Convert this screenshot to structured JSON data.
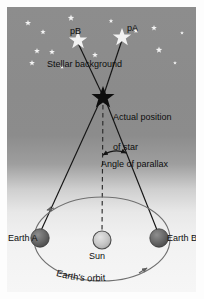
{
  "diagram": {
    "labels": {
      "star_pB": "pB",
      "star_pA": "pA",
      "stellar_background": "Stellar background",
      "actual_position_line1": "Actual position",
      "actual_position_line2": "of star",
      "angle_of_parallax": "Angle of parallax",
      "earth_a": "Earth A",
      "sun": "Sun",
      "earth_b": "Earth B",
      "earths_orbit": "Earth's orbit"
    },
    "colors": {
      "background_top": "#8d8d8d",
      "background_bottom": "#f6f6f6",
      "star_fill": "#f2f2f2",
      "actual_star_fill": "#0d0d0d",
      "line_stroke": "#141414",
      "orbit_stroke": "#6f6f6f",
      "earth_fill": "#666666",
      "sun_fill": "#c9c9c9",
      "text": "#0d0d0d"
    },
    "geometry": {
      "actual_star": {
        "x": 96,
        "y": 88
      },
      "star_pB_marker": {
        "x": 71,
        "y": 32
      },
      "star_pA_marker": {
        "x": 115,
        "y": 29
      },
      "earth_a": {
        "x": 33,
        "y": 231
      },
      "sun": {
        "x": 95,
        "y": 233
      },
      "earth_b": {
        "x": 152,
        "y": 231
      },
      "orbit_center": {
        "x": 95,
        "y": 232
      },
      "orbit_rx": 68,
      "orbit_ry": 42
    },
    "background_stars": [
      {
        "x": 21,
        "y": 16,
        "r": 3.2
      },
      {
        "x": 36,
        "y": 25,
        "r": 2.8
      },
      {
        "x": 64,
        "y": 11,
        "r": 3.4
      },
      {
        "x": 30,
        "y": 44,
        "r": 3.0
      },
      {
        "x": 45,
        "y": 45,
        "r": 3.0
      },
      {
        "x": 25,
        "y": 56,
        "r": 3.0
      },
      {
        "x": 55,
        "y": 60,
        "r": 2.2
      },
      {
        "x": 88,
        "y": 48,
        "r": 3.0
      },
      {
        "x": 104,
        "y": 14,
        "r": 2.4
      },
      {
        "x": 129,
        "y": 24,
        "r": 2.6
      },
      {
        "x": 147,
        "y": 21,
        "r": 3.0
      },
      {
        "x": 152,
        "y": 43,
        "r": 3.4
      },
      {
        "x": 175,
        "y": 26,
        "r": 2.0
      },
      {
        "x": 168,
        "y": 56,
        "r": 2.0
      }
    ]
  }
}
